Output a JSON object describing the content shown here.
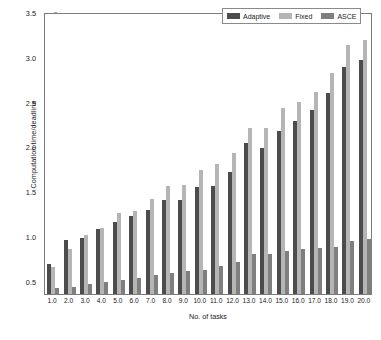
{
  "chart_data": {
    "type": "bar",
    "title": "",
    "xlabel": "No. of tasks",
    "ylabel": "Computation time/deadline",
    "categories": [
      "1.0",
      "2.0",
      "3.0",
      "4.0",
      "5.0",
      "6.0",
      "7.0",
      "8.0",
      "9.0",
      "10.0",
      "11.0",
      "12.0",
      "13.0",
      "14.0",
      "15.0",
      "16.0",
      "17.0",
      "18.0",
      "19.0",
      "20.0"
    ],
    "ylim": [
      0.35,
      3.5
    ],
    "yticks": [
      0.5,
      1.0,
      1.5,
      2.0,
      2.5,
      3.0,
      3.5
    ],
    "ytick_labels": [
      "0.5",
      "1.0",
      "1.5",
      "2.0",
      "2.5",
      "3.0",
      "3.5"
    ],
    "grid": false,
    "legend_position": "top-right",
    "series": [
      {
        "name": "Adaptive",
        "color": "#4c4c4c",
        "values": [
          0.68,
          0.95,
          0.98,
          1.08,
          1.15,
          1.22,
          1.29,
          1.4,
          1.4,
          1.55,
          1.56,
          1.71,
          2.04,
          1.98,
          2.17,
          2.28,
          2.4,
          2.59,
          2.89,
          2.96
        ]
      },
      {
        "name": "Fixed",
        "color": "#b5b5b5",
        "values": [
          0.65,
          0.85,
          1.01,
          1.09,
          1.25,
          1.28,
          1.41,
          1.56,
          1.57,
          1.74,
          1.8,
          1.93,
          2.21,
          2.2,
          2.43,
          2.5,
          2.61,
          2.82,
          3.13,
          3.19
        ]
      },
      {
        "name": "ASCE",
        "color": "#7f7f7f",
        "values": [
          0.42,
          0.43,
          0.46,
          0.48,
          0.51,
          0.53,
          0.56,
          0.58,
          0.61,
          0.62,
          0.66,
          0.71,
          0.8,
          0.8,
          0.83,
          0.85,
          0.86,
          0.88,
          0.94,
          0.97
        ]
      }
    ]
  }
}
